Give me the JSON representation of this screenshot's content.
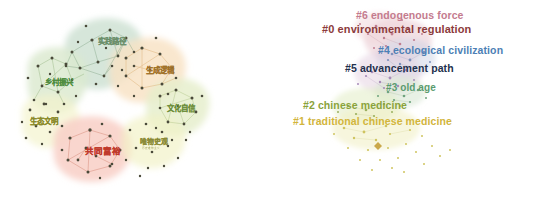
{
  "figure": {
    "type": "cluster-network-map-pair",
    "background": "#ffffff",
    "panels": [
      {
        "id": "left",
        "name": "chinese-keyword-cluster-map",
        "language": "zh",
        "clusters": [
          {
            "label": "实践路径",
            "color": "#6b8f6b",
            "blob": "#cfe0d2",
            "x": 98,
            "y": 38,
            "size": 7.5
          },
          {
            "label": "乡村振兴",
            "color": "#4e8c3f",
            "blob": "#dbe9c8",
            "x": 45,
            "y": 79,
            "size": 7.5
          },
          {
            "label": "生成逻辑",
            "color": "#a0722a",
            "blob": "#f6e1c4",
            "x": 146,
            "y": 67,
            "size": 7.5
          },
          {
            "label": "文化自信",
            "color": "#6f8f3c",
            "blob": "#e3ecc8",
            "x": 167,
            "y": 105,
            "size": 7.5
          },
          {
            "label": "生态文明",
            "color": "#8a8a2a",
            "blob": "#f2f2c8",
            "x": 30,
            "y": 118,
            "size": 7.5
          },
          {
            "label": "共同富裕",
            "color": "#c0392b",
            "blob": "#f6cdc4",
            "x": 85,
            "y": 147,
            "size": 8.5
          },
          {
            "label": "唯物史观",
            "color": "#8a8a35",
            "blob": "#f0f0c6",
            "x": 140,
            "y": 139,
            "size": 7.0,
            "sub": "历史唯物主义"
          }
        ]
      },
      {
        "id": "right",
        "name": "english-numbered-cluster-map",
        "language": "en",
        "clusters": [
          {
            "label": "#6 endogenous force",
            "color": "#c47b8e",
            "x": 356,
            "y": 16,
            "size": 10.5
          },
          {
            "label": "#0 environmental regulation",
            "color": "#8c3b3b",
            "x": 322,
            "y": 30,
            "size": 11.0
          },
          {
            "label": "#4 ecological civilization",
            "color": "#4d7fb5",
            "x": 378,
            "y": 50,
            "size": 10.5
          },
          {
            "label": "#5 advancement path",
            "color": "#23304d",
            "x": 345,
            "y": 68,
            "size": 10.5
          },
          {
            "label": "#3 old age",
            "color": "#5a9b6e",
            "x": 386,
            "y": 88,
            "size": 10.0
          },
          {
            "label": "#2 chinese medicine",
            "color": "#8aa33c",
            "x": 303,
            "y": 106,
            "size": 10.5
          },
          {
            "label": "#1 traditional chinese medicine",
            "color": "#d2b53c",
            "x": 293,
            "y": 122,
            "size": 10.5
          }
        ]
      }
    ],
    "legend_note": "",
    "node_color_default": "#4a4a3a"
  }
}
